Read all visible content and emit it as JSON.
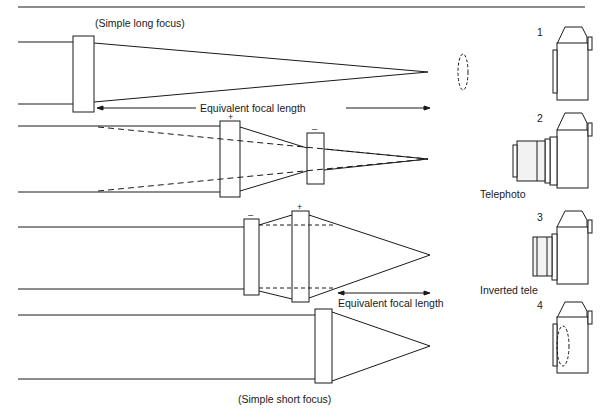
{
  "diagrams": [
    {
      "id": 1,
      "label": "(Simple long focus)",
      "dimension_label": "Equivalent focal length",
      "lenses": [
        {
          "sign": ""
        }
      ],
      "camera_number": "1",
      "camera_caption": ""
    },
    {
      "id": 2,
      "label": "",
      "lenses": [
        {
          "sign": "+"
        },
        {
          "sign": "–"
        }
      ],
      "camera_number": "2",
      "camera_caption": "Telephoto"
    },
    {
      "id": 3,
      "label": "",
      "dimension_label": "Equivalent focal length",
      "lenses": [
        {
          "sign": "–"
        },
        {
          "sign": "+"
        }
      ],
      "camera_number": "3",
      "camera_caption": "Inverted tele"
    },
    {
      "id": 4,
      "label": "(Simple short focus)",
      "lenses": [
        {
          "sign": ""
        }
      ],
      "camera_number": "4",
      "camera_caption": ""
    }
  ],
  "colors": {
    "line": "#1a1a1a",
    "background": "#ffffff"
  }
}
